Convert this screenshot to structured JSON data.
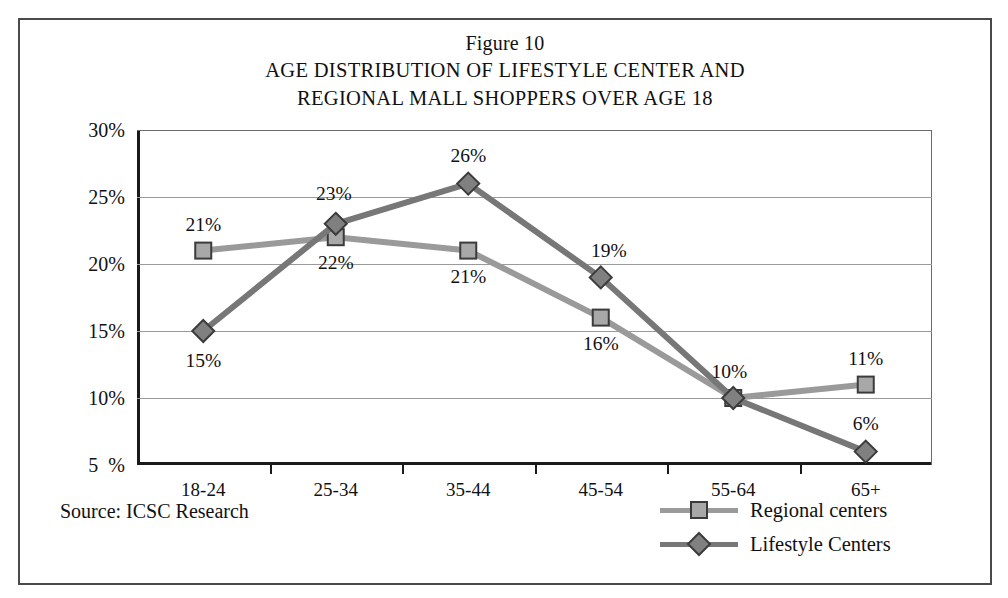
{
  "figure": {
    "number_label": "Figure 10",
    "title_line1": "AGE DISTRIBUTION OF LIFESTYLE CENTER AND",
    "title_line2": "REGIONAL MALL SHOPPERS OVER AGE 18"
  },
  "source_note": "Source: ICSC Research",
  "legend": {
    "items": [
      {
        "label": "Regional centers",
        "marker": "square-marker",
        "color": "#9a9a9a"
      },
      {
        "label": "Lifestyle Centers",
        "marker": "diamond-marker",
        "color": "#777777"
      }
    ]
  },
  "chart_data": {
    "type": "line",
    "title": "AGE DISTRIBUTION OF LIFESTYLE CENTER AND REGIONAL MALL SHOPPERS OVER AGE 18",
    "subtitle": "Figure 10",
    "xlabel": "",
    "ylabel": "",
    "categories": [
      "18-24",
      "25-34",
      "35-44",
      "45-54",
      "55-64",
      "65+"
    ],
    "ytick_labels": [
      "30%",
      "25%",
      "20%",
      "15%",
      "10%",
      "5  %"
    ],
    "yticks": [
      30,
      25,
      20,
      15,
      10,
      5
    ],
    "ylim": [
      5,
      30
    ],
    "grid": true,
    "legend_position": "bottom-right",
    "series": [
      {
        "name": "Regional centers",
        "marker": "square",
        "color": "#9a9a9a",
        "marker_fill": "#a8a8a8",
        "values": [
          21,
          22,
          21,
          16,
          10,
          11
        ],
        "data_labels": [
          "21%",
          "22%",
          "21%",
          "16%",
          "10%",
          "11%"
        ]
      },
      {
        "name": "Lifestyle Centers",
        "marker": "diamond",
        "color": "#777777",
        "marker_fill": "#808080",
        "values": [
          15,
          23,
          26,
          19,
          10,
          6
        ],
        "data_labels": [
          "15%",
          "23%",
          "26%",
          "19%",
          "10%",
          "6%"
        ]
      }
    ]
  }
}
